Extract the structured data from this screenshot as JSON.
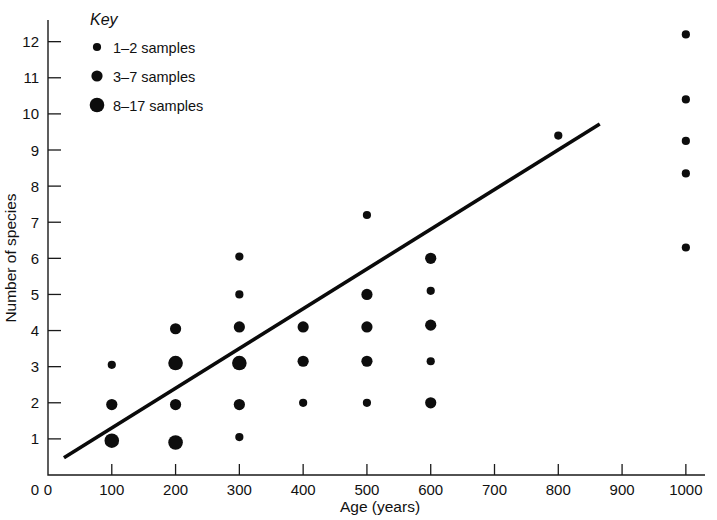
{
  "chart_data": {
    "type": "scatter",
    "title": "",
    "xlabel": "Age (years)",
    "ylabel": "Number of species",
    "xlim": [
      0,
      1030
    ],
    "ylim": [
      0,
      12.6
    ],
    "xticks": [
      0,
      100,
      200,
      300,
      400,
      500,
      600,
      700,
      800,
      900,
      1000
    ],
    "xtick_labels": [
      "0",
      "100",
      "200",
      "300",
      "400",
      "500",
      "600",
      "700",
      "800",
      "900",
      "1000"
    ],
    "yticks": [
      1,
      2,
      3,
      4,
      5,
      6,
      7,
      8,
      9,
      10,
      11,
      12
    ],
    "ytick_labels": [
      "1",
      "2",
      "3",
      "4",
      "5",
      "6",
      "7",
      "8",
      "9",
      "10",
      "11",
      "12"
    ],
    "grid": false,
    "legend_position": "top-left",
    "size_encoding": "marker area encodes number of samples",
    "points": [
      {
        "x": 100,
        "y": 3.05,
        "size": "small",
        "samples": "1-2"
      },
      {
        "x": 100,
        "y": 1.95,
        "size": "medium",
        "samples": "3-7"
      },
      {
        "x": 100,
        "y": 0.95,
        "size": "large",
        "samples": "8-17"
      },
      {
        "x": 200,
        "y": 4.05,
        "size": "medium",
        "samples": "3-7"
      },
      {
        "x": 200,
        "y": 3.1,
        "size": "large",
        "samples": "8-17"
      },
      {
        "x": 200,
        "y": 1.95,
        "size": "medium",
        "samples": "3-7"
      },
      {
        "x": 200,
        "y": 0.9,
        "size": "large",
        "samples": "8-17"
      },
      {
        "x": 300,
        "y": 6.05,
        "size": "small",
        "samples": "1-2"
      },
      {
        "x": 300,
        "y": 5.0,
        "size": "small",
        "samples": "1-2"
      },
      {
        "x": 300,
        "y": 4.1,
        "size": "medium",
        "samples": "3-7"
      },
      {
        "x": 300,
        "y": 3.1,
        "size": "large",
        "samples": "8-17"
      },
      {
        "x": 300,
        "y": 1.95,
        "size": "medium",
        "samples": "3-7"
      },
      {
        "x": 300,
        "y": 1.05,
        "size": "small",
        "samples": "1-2"
      },
      {
        "x": 400,
        "y": 4.1,
        "size": "medium",
        "samples": "3-7"
      },
      {
        "x": 400,
        "y": 3.15,
        "size": "medium",
        "samples": "3-7"
      },
      {
        "x": 400,
        "y": 2.0,
        "size": "small",
        "samples": "1-2"
      },
      {
        "x": 500,
        "y": 7.2,
        "size": "small",
        "samples": "1-2"
      },
      {
        "x": 500,
        "y": 5.0,
        "size": "medium",
        "samples": "3-7"
      },
      {
        "x": 500,
        "y": 4.1,
        "size": "medium",
        "samples": "3-7"
      },
      {
        "x": 500,
        "y": 3.15,
        "size": "medium",
        "samples": "3-7"
      },
      {
        "x": 500,
        "y": 2.0,
        "size": "small",
        "samples": "1-2"
      },
      {
        "x": 600,
        "y": 6.0,
        "size": "medium",
        "samples": "3-7"
      },
      {
        "x": 600,
        "y": 5.1,
        "size": "small",
        "samples": "1-2"
      },
      {
        "x": 600,
        "y": 4.15,
        "size": "medium",
        "samples": "3-7"
      },
      {
        "x": 600,
        "y": 3.15,
        "size": "small",
        "samples": "1-2"
      },
      {
        "x": 600,
        "y": 2.0,
        "size": "medium",
        "samples": "3-7"
      },
      {
        "x": 800,
        "y": 9.4,
        "size": "small",
        "samples": "1-2"
      },
      {
        "x": 1000,
        "y": 12.2,
        "size": "small",
        "samples": "1-2"
      },
      {
        "x": 1000,
        "y": 10.4,
        "size": "small",
        "samples": "1-2"
      },
      {
        "x": 1000,
        "y": 9.25,
        "size": "small",
        "samples": "1-2"
      },
      {
        "x": 1000,
        "y": 8.35,
        "size": "small",
        "samples": "1-2"
      },
      {
        "x": 1000,
        "y": 6.3,
        "size": "small",
        "samples": "1-2"
      }
    ],
    "fit_line": {
      "label": "regression line",
      "x_start": 25,
      "y_start": 0.48,
      "x_end": 865,
      "y_end": 9.72
    }
  },
  "legend": {
    "title": "Key",
    "entries": [
      {
        "label": "1–2 samples",
        "size": "small"
      },
      {
        "label": "3–7 samples",
        "size": "medium"
      },
      {
        "label": "8–17 samples",
        "size": "large"
      }
    ]
  },
  "marker_radii": {
    "small": 4.1,
    "medium": 5.6,
    "large": 7.3
  },
  "colors": {
    "ink": "#0d0d0d",
    "axis": "#1a1a1a",
    "background": "#ffffff"
  }
}
